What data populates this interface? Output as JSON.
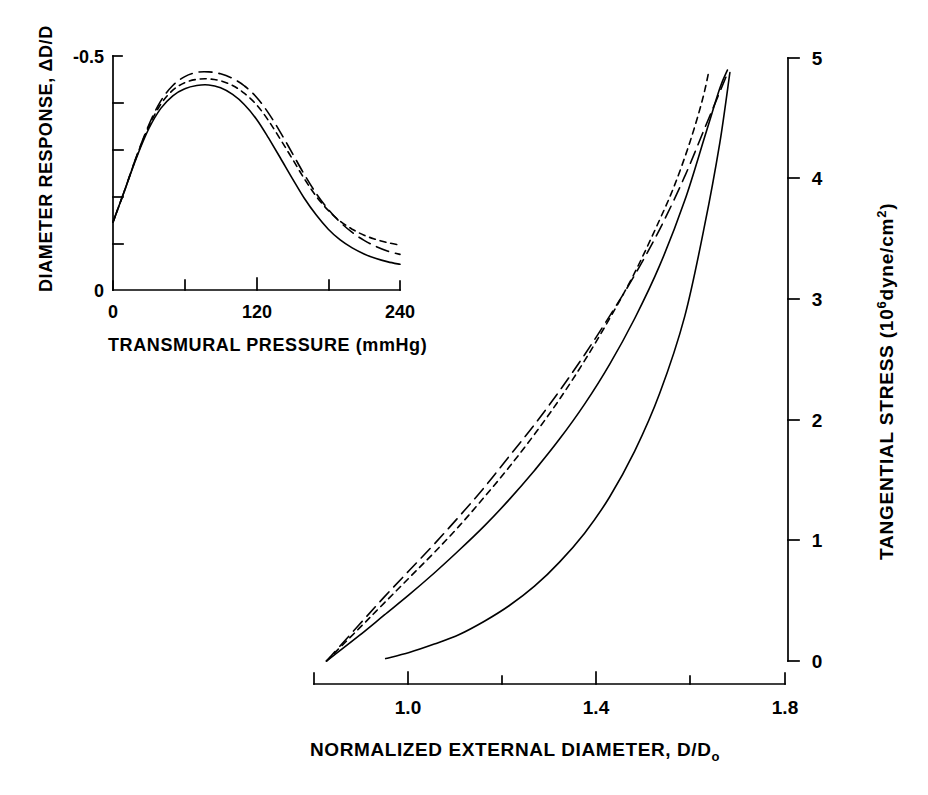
{
  "figure": {
    "background": "#ffffff",
    "ink": "#000000",
    "width": 928,
    "height": 795
  },
  "main_axis": {
    "x_label": "NORMALIZED EXTERNAL DIAMETER,  D/D",
    "x_label_sub": "o",
    "x_ticks": [
      "1.0",
      "1.4",
      "1.8"
    ],
    "x_minor_ticks": [
      "1.2",
      "1.6"
    ],
    "y_label_main": "TANGENTIAL  STRESS",
    "y_label_units_pre": "(10",
    "y_label_units_sup": "6",
    "y_label_units_post": "dyne/cm",
    "y_label_units_sup2": "2",
    "y_label_units_close": ")",
    "y_ticks": [
      "5",
      "4",
      "3",
      "2",
      "1",
      "0"
    ]
  },
  "inset_axis": {
    "x_label": "TRANSMURAL  PRESSURE  (mmHg)",
    "x_ticks": [
      "0",
      "120",
      "240"
    ],
    "y_label": "DIAMETER  RESPONSE,  ΔD/D",
    "y_ticks": [
      "-0.5",
      "0"
    ]
  },
  "chart_data": {
    "type": "line",
    "title": "",
    "charts": [
      {
        "name": "main-panel",
        "type": "line",
        "xlabel": "NORMALIZED EXTERNAL DIAMETER, D/Do",
        "ylabel": "TANGENTIAL STRESS (10^6 dyne/cm^2)",
        "xlim": [
          0.86,
          1.8
        ],
        "ylim": [
          0,
          5
        ],
        "grid": false,
        "legend": "none",
        "x_ticks": [
          1.0,
          1.4,
          1.8
        ],
        "x_minor_ticks": [
          1.2,
          1.6
        ],
        "y_ticks": [
          0,
          1,
          2,
          3,
          4,
          5
        ],
        "series": [
          {
            "name": "long-dashed-curve",
            "style": "long-dash",
            "points": [
              [
                0.885,
                0.0
              ],
              [
                0.95,
                0.3
              ],
              [
                1.0,
                0.53
              ],
              [
                1.05,
                0.75
              ],
              [
                1.1,
                0.97
              ],
              [
                1.15,
                1.2
              ],
              [
                1.2,
                1.44
              ],
              [
                1.25,
                1.7
              ],
              [
                1.3,
                1.96
              ],
              [
                1.35,
                2.24
              ],
              [
                1.4,
                2.54
              ],
              [
                1.45,
                2.86
              ],
              [
                1.5,
                3.2
              ],
              [
                1.55,
                3.58
              ],
              [
                1.6,
                4.02
              ],
              [
                1.64,
                4.42
              ],
              [
                1.67,
                4.72
              ],
              [
                1.685,
                4.87
              ]
            ]
          },
          {
            "name": "short-dashed-curve",
            "style": "short-dash",
            "points": [
              [
                0.885,
                0.0
              ],
              [
                0.95,
                0.27
              ],
              [
                1.0,
                0.48
              ],
              [
                1.05,
                0.69
              ],
              [
                1.1,
                0.9
              ],
              [
                1.15,
                1.12
              ],
              [
                1.2,
                1.36
              ],
              [
                1.25,
                1.61
              ],
              [
                1.3,
                1.88
              ],
              [
                1.35,
                2.17
              ],
              [
                1.4,
                2.49
              ],
              [
                1.45,
                2.84
              ],
              [
                1.5,
                3.22
              ],
              [
                1.55,
                3.66
              ],
              [
                1.58,
                3.95
              ],
              [
                1.61,
                4.3
              ],
              [
                1.635,
                4.65
              ],
              [
                1.648,
                4.89
              ]
            ]
          },
          {
            "name": "solid-curve-upper",
            "style": "solid",
            "points": [
              [
                0.885,
                0.0
              ],
              [
                0.95,
                0.21
              ],
              [
                1.0,
                0.38
              ],
              [
                1.05,
                0.55
              ],
              [
                1.1,
                0.73
              ],
              [
                1.15,
                0.92
              ],
              [
                1.2,
                1.12
              ],
              [
                1.25,
                1.34
              ],
              [
                1.3,
                1.58
              ],
              [
                1.35,
                1.84
              ],
              [
                1.4,
                2.13
              ],
              [
                1.45,
                2.46
              ],
              [
                1.5,
                2.84
              ],
              [
                1.55,
                3.28
              ],
              [
                1.6,
                3.82
              ],
              [
                1.64,
                4.35
              ],
              [
                1.67,
                4.75
              ],
              [
                1.685,
                4.9
              ]
            ]
          },
          {
            "name": "solid-curve-lower",
            "style": "solid",
            "points": [
              [
                1.003,
                0.02
              ],
              [
                1.05,
                0.07
              ],
              [
                1.1,
                0.14
              ],
              [
                1.15,
                0.22
              ],
              [
                1.2,
                0.33
              ],
              [
                1.25,
                0.46
              ],
              [
                1.3,
                0.62
              ],
              [
                1.35,
                0.82
              ],
              [
                1.4,
                1.06
              ],
              [
                1.45,
                1.36
              ],
              [
                1.5,
                1.74
              ],
              [
                1.55,
                2.22
              ],
              [
                1.6,
                2.86
              ],
              [
                1.64,
                3.62
              ],
              [
                1.67,
                4.3
              ],
              [
                1.69,
                4.88
              ]
            ]
          }
        ]
      },
      {
        "name": "inset-panel",
        "type": "line",
        "xlabel": "TRANSMURAL PRESSURE (mmHg)",
        "ylabel": "DIAMETER RESPONSE, ΔD/D",
        "xlim": [
          0,
          240
        ],
        "ylim": [
          0,
          -0.5
        ],
        "grid": false,
        "legend": "none",
        "x_ticks": [
          0,
          120,
          240
        ],
        "x_minor_ticks": [
          60,
          180
        ],
        "y_ticks": [
          0,
          -0.5
        ],
        "y_minor_count": 4,
        "series": [
          {
            "name": "inset-solid-curve",
            "style": "solid",
            "points": [
              [
                0,
                -0.145
              ],
              [
                10,
                -0.215
              ],
              [
                20,
                -0.285
              ],
              [
                30,
                -0.345
              ],
              [
                40,
                -0.388
              ],
              [
                50,
                -0.415
              ],
              [
                60,
                -0.43
              ],
              [
                70,
                -0.437
              ],
              [
                80,
                -0.438
              ],
              [
                90,
                -0.432
              ],
              [
                100,
                -0.418
              ],
              [
                110,
                -0.396
              ],
              [
                120,
                -0.365
              ],
              [
                130,
                -0.325
              ],
              [
                140,
                -0.282
              ],
              [
                150,
                -0.238
              ],
              [
                160,
                -0.196
              ],
              [
                170,
                -0.16
              ],
              [
                180,
                -0.13
              ],
              [
                190,
                -0.107
              ],
              [
                200,
                -0.09
              ],
              [
                210,
                -0.077
              ],
              [
                220,
                -0.067
              ],
              [
                230,
                -0.06
              ],
              [
                240,
                -0.055
              ]
            ]
          },
          {
            "name": "inset-short-dashed-curve",
            "style": "short-dash",
            "points": [
              [
                0,
                -0.145
              ],
              [
                10,
                -0.215
              ],
              [
                20,
                -0.287
              ],
              [
                30,
                -0.35
              ],
              [
                40,
                -0.397
              ],
              [
                50,
                -0.427
              ],
              [
                60,
                -0.443
              ],
              [
                70,
                -0.45
              ],
              [
                80,
                -0.451
              ],
              [
                90,
                -0.447
              ],
              [
                100,
                -0.437
              ],
              [
                110,
                -0.42
              ],
              [
                120,
                -0.396
              ],
              [
                130,
                -0.362
              ],
              [
                140,
                -0.322
              ],
              [
                150,
                -0.28
              ],
              [
                160,
                -0.238
              ],
              [
                170,
                -0.2
              ],
              [
                180,
                -0.17
              ],
              [
                190,
                -0.147
              ],
              [
                200,
                -0.13
              ],
              [
                210,
                -0.117
              ],
              [
                220,
                -0.108
              ],
              [
                230,
                -0.101
              ],
              [
                240,
                -0.096
              ]
            ]
          },
          {
            "name": "inset-long-dashed-curve",
            "style": "long-dash",
            "points": [
              [
                0,
                -0.145
              ],
              [
                10,
                -0.215
              ],
              [
                20,
                -0.288
              ],
              [
                30,
                -0.353
              ],
              [
                40,
                -0.404
              ],
              [
                50,
                -0.437
              ],
              [
                60,
                -0.456
              ],
              [
                70,
                -0.465
              ],
              [
                80,
                -0.466
              ],
              [
                90,
                -0.462
              ],
              [
                100,
                -0.452
              ],
              [
                110,
                -0.436
              ],
              [
                120,
                -0.412
              ],
              [
                130,
                -0.378
              ],
              [
                140,
                -0.337
              ],
              [
                150,
                -0.292
              ],
              [
                160,
                -0.247
              ],
              [
                170,
                -0.206
              ],
              [
                180,
                -0.172
              ],
              [
                190,
                -0.145
              ],
              [
                200,
                -0.123
              ],
              [
                210,
                -0.106
              ],
              [
                220,
                -0.093
              ],
              [
                230,
                -0.083
              ],
              [
                240,
                -0.076
              ]
            ]
          }
        ]
      }
    ]
  }
}
